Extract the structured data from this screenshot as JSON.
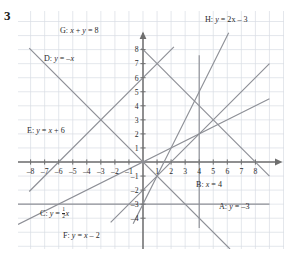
{
  "question_number": "3",
  "chart_data": {
    "type": "line",
    "title": "",
    "xlabel": "x",
    "ylabel": "y",
    "grid": true,
    "legend": "inline-labels",
    "xlim": [
      -9,
      9
    ],
    "ylim": [
      -5,
      9
    ],
    "x_ticks": [
      -8,
      -7,
      -6,
      -5,
      -4,
      -3,
      -2,
      -1,
      1,
      2,
      3,
      4,
      5,
      6,
      7,
      8
    ],
    "y_ticks": [
      -4,
      -3,
      -2,
      -1,
      1,
      2,
      3,
      4,
      5,
      6,
      7,
      8
    ],
    "x_tick_labels": [
      "-8",
      "-7",
      "-6",
      "-5",
      "-4",
      "-3",
      "-2",
      "-1",
      "1",
      "2",
      "3",
      "4",
      "5",
      "6",
      "7",
      "8"
    ],
    "y_tick_labels": [
      "-4",
      "-3",
      "-2",
      "-1",
      "1",
      "2",
      "3",
      "4",
      "5",
      "6",
      "7",
      "8"
    ],
    "series": [
      {
        "id": "A",
        "label_text": "A: y = -3",
        "kind": "horizontal",
        "equation": "y = -3",
        "slope": 0,
        "intercept": -3
      },
      {
        "id": "B",
        "label_text": "B: x = 4",
        "kind": "vertical",
        "equation": "x = 4",
        "x_value": 4
      },
      {
        "id": "C",
        "label_text": "C: y = 1/2 x",
        "kind": "linear",
        "equation": "y = (1/2)x",
        "slope": 0.5,
        "intercept": 0
      },
      {
        "id": "D",
        "label_text": "D: y = -x",
        "kind": "linear",
        "equation": "y = -x",
        "slope": -1,
        "intercept": 0
      },
      {
        "id": "E",
        "label_text": "E: y = x + 6",
        "kind": "linear",
        "equation": "y = x + 6",
        "slope": 1,
        "intercept": 6
      },
      {
        "id": "F",
        "label_text": "F: y = x - 2",
        "kind": "linear",
        "equation": "y = x - 2",
        "slope": 1,
        "intercept": -2
      },
      {
        "id": "G",
        "label_text": "G: x + y = 8",
        "kind": "linear",
        "equation": "x + y = 8",
        "slope": -1,
        "intercept": 8
      },
      {
        "id": "H",
        "label_text": "H: y = 2x - 3",
        "kind": "linear",
        "equation": "y = 2x - 3",
        "slope": 2,
        "intercept": -3
      }
    ],
    "colors": {
      "grid": "#d9dce4",
      "axis": "#6e6e6e",
      "line": "#8d8f96",
      "text": "#2b2b2b"
    }
  },
  "labels": {
    "A": {
      "prefix": "A: ",
      "body_html": "y = –3"
    },
    "B": {
      "prefix": "B: ",
      "body_html": "x = 4"
    },
    "C": {
      "prefix": "C: ",
      "body_html": "y = ½x"
    },
    "D": {
      "prefix": "D: ",
      "body_html": "y = –x"
    },
    "E": {
      "prefix": "E: ",
      "body_html": "y = x + 6"
    },
    "F": {
      "prefix": "F: ",
      "body_html": "y = x – 2"
    },
    "G": {
      "prefix": "G: ",
      "body_html": "x + y = 8"
    },
    "H": {
      "prefix": "H: ",
      "body_html": "y = 2x – 3"
    }
  },
  "label_text": {
    "A": "A: y = –3",
    "B": "B: x = 4",
    "C": "C: y = ½x",
    "D": "D: y = –x",
    "E": "E: y = x + 6",
    "F": "F: y = x – 2",
    "G": "G: x + y = 8",
    "H": "H: y = 2x – 3"
  }
}
